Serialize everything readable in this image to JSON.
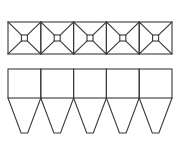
{
  "diagram": {
    "stroke_color": "#3a3a3a",
    "stroke_width": 1.1,
    "background": "#ffffff",
    "top_view": {
      "label": "top-view-roof-pyramids",
      "x": 8,
      "y": 22,
      "cell_width": 32.8,
      "height": 32,
      "cells": 5,
      "inner_square_size": 6
    },
    "front_view": {
      "label": "front-view-hoppers",
      "x": 8,
      "y": 69,
      "cell_width": 32.8,
      "box_height": 29,
      "hopper_depth": 35,
      "hopper_outlet_width": 6.6,
      "cells": 5
    }
  }
}
